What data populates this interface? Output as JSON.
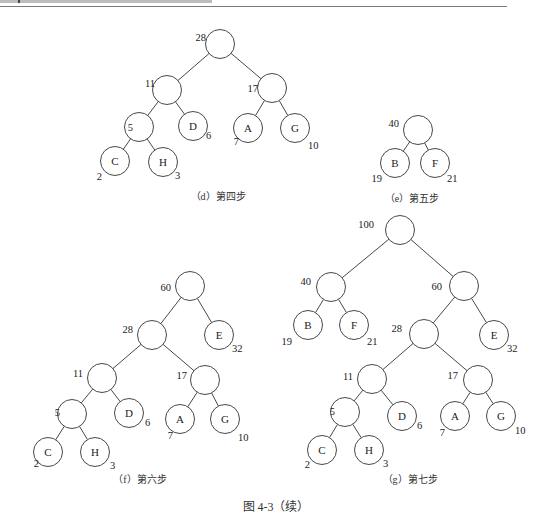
{
  "header": {
    "running_head": ""
  },
  "figure": {
    "caption": "图 4-3（续）"
  },
  "panels": [
    {
      "id": "d",
      "caption": "（d）第四步",
      "caption_pos": [
        218,
        200
      ],
      "nodes": [
        {
          "id": "n28",
          "x": 220,
          "y": 44,
          "label": "",
          "w": "28",
          "wx": -22,
          "wy": -3
        },
        {
          "id": "n11",
          "x": 167,
          "y": 90,
          "label": "",
          "w": "11",
          "wx": -20,
          "wy": -3
        },
        {
          "id": "n17",
          "x": 272,
          "y": 88,
          "label": "",
          "w": "17",
          "wx": -22,
          "wy": 4
        },
        {
          "id": "n5",
          "x": 139,
          "y": 127,
          "label": "",
          "w": "5",
          "wx": -14,
          "wy": 4
        },
        {
          "id": "nD",
          "x": 193,
          "y": 126,
          "label": "D",
          "w": "6",
          "wx": 13,
          "wy": 13
        },
        {
          "id": "nA",
          "x": 248,
          "y": 128,
          "label": "A",
          "w": "7",
          "wx": -17,
          "wy": 17
        },
        {
          "id": "nG",
          "x": 295,
          "y": 128,
          "label": "G",
          "w": "10",
          "wx": 13,
          "wy": 21
        },
        {
          "id": "nC",
          "x": 115,
          "y": 161,
          "label": "C",
          "w": "2",
          "wx": -21,
          "wy": 19
        },
        {
          "id": "nH",
          "x": 163,
          "y": 162,
          "label": "H",
          "w": "3",
          "wx": 12,
          "wy": 17
        }
      ],
      "edges": [
        [
          "n28",
          "n11"
        ],
        [
          "n28",
          "n17"
        ],
        [
          "n11",
          "n5"
        ],
        [
          "n11",
          "nD"
        ],
        [
          "n17",
          "nA"
        ],
        [
          "n17",
          "nG"
        ],
        [
          "n5",
          "nC"
        ],
        [
          "n5",
          "nH"
        ]
      ]
    },
    {
      "id": "e",
      "caption": "（e）第五步",
      "caption_pos": [
        412,
        202
      ],
      "nodes": [
        {
          "id": "n40",
          "x": 418,
          "y": 130,
          "label": "",
          "w": "40",
          "wx": -27,
          "wy": -3
        },
        {
          "id": "nB",
          "x": 395,
          "y": 163,
          "label": "B",
          "w": "19",
          "wx": -21,
          "wy": 19
        },
        {
          "id": "nF",
          "x": 435,
          "y": 163,
          "label": "F",
          "w": "21",
          "wx": 12,
          "wy": 19
        }
      ],
      "edges": [
        [
          "n40",
          "nB"
        ],
        [
          "n40",
          "nF"
        ]
      ]
    },
    {
      "id": "f",
      "caption": "（f）第六步",
      "caption_pos": [
        140,
        483
      ],
      "nodes": [
        {
          "id": "n60",
          "x": 190,
          "y": 286,
          "label": "",
          "w": "60",
          "wx": -27,
          "wy": 5
        },
        {
          "id": "n28",
          "x": 152,
          "y": 335,
          "label": "",
          "w": "28",
          "wx": -27,
          "wy": -2
        },
        {
          "id": "nE",
          "x": 219,
          "y": 335,
          "label": "E",
          "w": "32",
          "wx": 13,
          "wy": 17
        },
        {
          "id": "n11",
          "x": 102,
          "y": 378,
          "label": "",
          "w": "11",
          "wx": -27,
          "wy": -1
        },
        {
          "id": "n17",
          "x": 205,
          "y": 380,
          "label": "",
          "w": "17",
          "wx": -26,
          "wy": -1
        },
        {
          "id": "n5",
          "x": 72,
          "y": 414,
          "label": "",
          "w": "5",
          "wx": -20,
          "wy": 2
        },
        {
          "id": "nD",
          "x": 129,
          "y": 413,
          "label": "D",
          "w": "6",
          "wx": 16,
          "wy": 13
        },
        {
          "id": "nA",
          "x": 180,
          "y": 419,
          "label": "A",
          "w": "7",
          "wx": -15,
          "wy": 20
        },
        {
          "id": "nG",
          "x": 225,
          "y": 419,
          "label": "G",
          "w": "10",
          "wx": 13,
          "wy": 22
        },
        {
          "id": "nC",
          "x": 48,
          "y": 452,
          "label": "C",
          "w": "2",
          "wx": -17,
          "wy": 15
        },
        {
          "id": "nH",
          "x": 95,
          "y": 452,
          "label": "H",
          "w": "3",
          "wx": 15,
          "wy": 17
        }
      ],
      "edges": [
        [
          "n60",
          "n28"
        ],
        [
          "n60",
          "nE"
        ],
        [
          "n28",
          "n11"
        ],
        [
          "n28",
          "n17"
        ],
        [
          "n11",
          "n5"
        ],
        [
          "n11",
          "nD"
        ],
        [
          "n17",
          "nA"
        ],
        [
          "n17",
          "nG"
        ],
        [
          "n5",
          "nC"
        ],
        [
          "n5",
          "nH"
        ]
      ]
    },
    {
      "id": "g",
      "caption": "（g）第七步",
      "caption_pos": [
        410,
        483
      ],
      "nodes": [
        {
          "id": "n100",
          "x": 400,
          "y": 230,
          "label": "",
          "w": "100",
          "wx": -34,
          "wy": -2
        },
        {
          "id": "n40",
          "x": 331,
          "y": 287,
          "label": "",
          "w": "40",
          "wx": -28,
          "wy": -2
        },
        {
          "id": "n60",
          "x": 464,
          "y": 286,
          "label": "",
          "w": "60",
          "wx": -30,
          "wy": 4
        },
        {
          "id": "nB",
          "x": 308,
          "y": 325,
          "label": "B",
          "w": "19",
          "wx": -24,
          "wy": 20
        },
        {
          "id": "nF",
          "x": 354,
          "y": 325,
          "label": "F",
          "w": "21",
          "wx": 13,
          "wy": 20
        },
        {
          "id": "n28",
          "x": 424,
          "y": 334,
          "label": "",
          "w": "28",
          "wx": -30,
          "wy": -2
        },
        {
          "id": "nE",
          "x": 494,
          "y": 335,
          "label": "E",
          "w": "32",
          "wx": 13,
          "wy": 17
        },
        {
          "id": "n11",
          "x": 372,
          "y": 379,
          "label": "",
          "w": "11",
          "wx": -27,
          "wy": 1
        },
        {
          "id": "n17",
          "x": 478,
          "y": 380,
          "label": "",
          "w": "17",
          "wx": -28,
          "wy": -1
        },
        {
          "id": "n5",
          "x": 345,
          "y": 412,
          "label": "",
          "w": "5",
          "wx": -18,
          "wy": 3
        },
        {
          "id": "nD",
          "x": 402,
          "y": 416,
          "label": "D",
          "w": "6",
          "wx": 15,
          "wy": 13
        },
        {
          "id": "nA",
          "x": 455,
          "y": 416,
          "label": "A",
          "w": "7",
          "wx": -18,
          "wy": 20
        },
        {
          "id": "nG",
          "x": 501,
          "y": 416,
          "label": "G",
          "w": "10",
          "wx": 14,
          "wy": 18
        },
        {
          "id": "nC",
          "x": 322,
          "y": 450,
          "label": "C",
          "w": "2",
          "wx": -20,
          "wy": 18
        },
        {
          "id": "nH",
          "x": 369,
          "y": 450,
          "label": "H",
          "w": "3",
          "wx": 14,
          "wy": 17
        }
      ],
      "edges": [
        [
          "n100",
          "n40"
        ],
        [
          "n100",
          "n60"
        ],
        [
          "n40",
          "nB"
        ],
        [
          "n40",
          "nF"
        ],
        [
          "n60",
          "n28"
        ],
        [
          "n60",
          "nE"
        ],
        [
          "n28",
          "n11"
        ],
        [
          "n28",
          "n17"
        ],
        [
          "n11",
          "n5"
        ],
        [
          "n11",
          "nD"
        ],
        [
          "n17",
          "nA"
        ],
        [
          "n17",
          "nG"
        ],
        [
          "n5",
          "nC"
        ],
        [
          "n5",
          "nH"
        ]
      ]
    }
  ],
  "style": {
    "node_radius": 14.5,
    "stroke": "#333333",
    "background": "#ffffff"
  }
}
